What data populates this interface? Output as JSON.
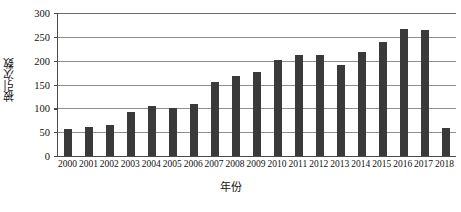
{
  "chart_data": {
    "type": "bar",
    "title": "",
    "subtitle": "",
    "xlabel": "年份",
    "ylabel": "被引次数",
    "categories": [
      "2000",
      "2001",
      "2002",
      "2003",
      "2004",
      "2005",
      "2006",
      "2007",
      "2008",
      "2009",
      "2010",
      "2011",
      "2012",
      "2013",
      "2014",
      "2015",
      "2016",
      "2017",
      "2018"
    ],
    "values": [
      57,
      60,
      65,
      92,
      105,
      100,
      110,
      156,
      167,
      176,
      201,
      212,
      212,
      190,
      218,
      240,
      267,
      265,
      58
    ],
    "series": [
      {
        "name": "被引次数",
        "values": [
          57,
          60,
          65,
          92,
          105,
          100,
          110,
          156,
          167,
          176,
          201,
          212,
          212,
          190,
          218,
          240,
          267,
          265,
          58
        ]
      }
    ],
    "ylim": [
      0,
      300
    ],
    "yticks": [
      0,
      50,
      100,
      150,
      200,
      250,
      300
    ],
    "ytick_labels": [
      "0",
      "50",
      "100",
      "150",
      "200",
      "250",
      "300"
    ],
    "grid": "horizontal",
    "legend": "none",
    "bar_color": "#3a3a3a",
    "gridline_color": "#8e8e8e",
    "axis_color": "#4a4a4a",
    "background_color": "#ffffff"
  }
}
